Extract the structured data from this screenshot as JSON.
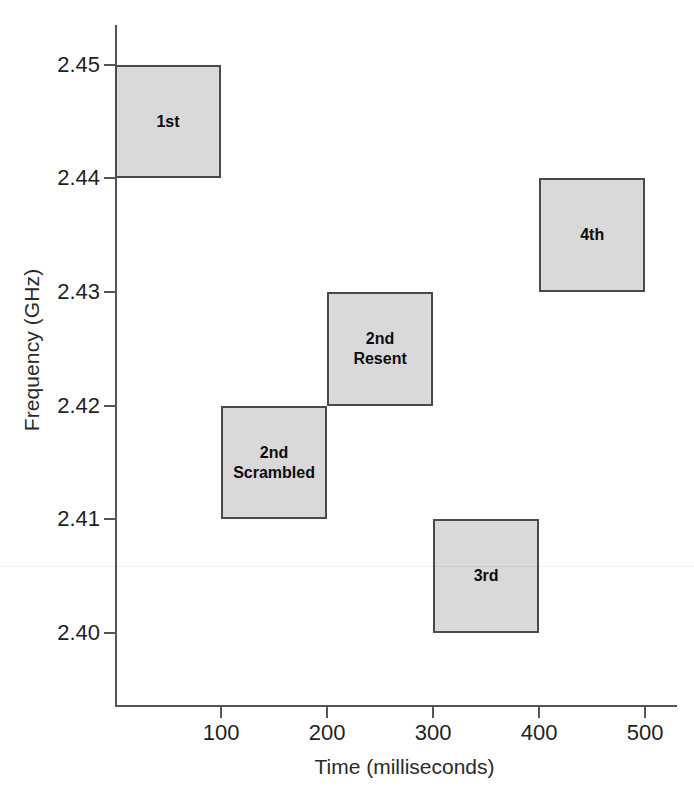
{
  "chart_data": {
    "type": "bar",
    "title": "",
    "xlabel": "Time (milliseconds)",
    "ylabel": "Frequency (GHz)",
    "xlim": [
      0,
      530
    ],
    "ylim": [
      2.3935,
      2.4535
    ],
    "grid": false,
    "legend": "none",
    "xticks": [
      100,
      200,
      300,
      400,
      500
    ],
    "xtick_labels": [
      "100",
      "200",
      "300",
      "400",
      "500"
    ],
    "yticks": [
      2.4,
      2.41,
      2.42,
      2.43,
      2.44,
      2.45
    ],
    "ytick_labels": [
      "2.40",
      "2.41",
      "2.42",
      "2.43",
      "2.44",
      "2.45"
    ],
    "boxes": [
      {
        "label": "1st",
        "x_start": 0,
        "x_end": 100,
        "y_start": 2.44,
        "y_end": 2.45
      },
      {
        "label": "2nd\nScrambled",
        "x_start": 100,
        "x_end": 200,
        "y_start": 2.41,
        "y_end": 2.42
      },
      {
        "label": "2nd\nResent",
        "x_start": 200,
        "x_end": 300,
        "y_start": 2.42,
        "y_end": 2.43
      },
      {
        "label": "3rd",
        "x_start": 300,
        "x_end": 400,
        "y_start": 2.4,
        "y_end": 2.41
      },
      {
        "label": "4th",
        "x_start": 400,
        "x_end": 500,
        "y_start": 2.43,
        "y_end": 2.44
      }
    ],
    "colors": {
      "box_fill": "#d9d9d9",
      "box_stroke": "#4a4a4a",
      "axis": "#555555",
      "text": "#1f1f1f",
      "background": "#ffffff"
    }
  }
}
